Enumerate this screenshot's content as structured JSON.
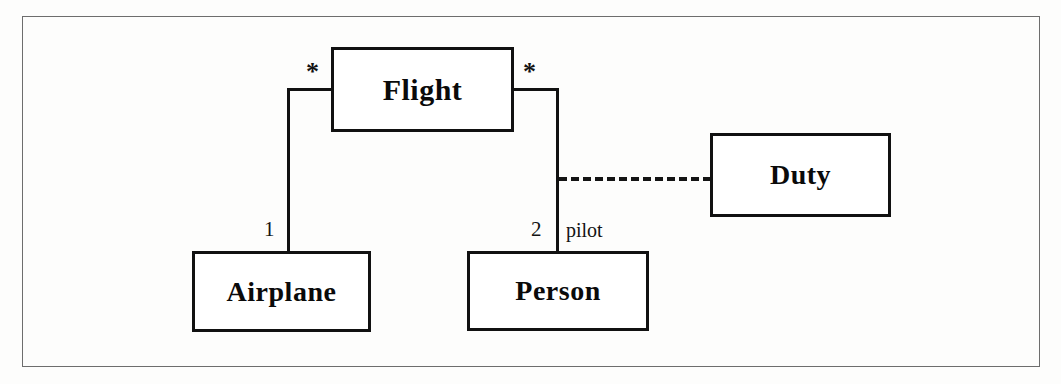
{
  "diagram": {
    "type": "uml-class-diagram",
    "frame": {
      "stroke": "#6d6d6d"
    },
    "background": "#fdfdfc",
    "line_color": "#111111",
    "classes": [
      {
        "id": "flight",
        "name": "Flight",
        "x": 331,
        "y": 47,
        "width": 183,
        "height": 85,
        "font_size": 30
      },
      {
        "id": "airplane",
        "name": "Airplane",
        "x": 192,
        "y": 251,
        "width": 179,
        "height": 81,
        "font_size": 28
      },
      {
        "id": "person",
        "name": "Person",
        "x": 467,
        "y": 251,
        "width": 182,
        "height": 80,
        "font_size": 28
      },
      {
        "id": "duty",
        "name": "Duty",
        "x": 710,
        "y": 133,
        "width": 181,
        "height": 84,
        "font_size": 28
      }
    ],
    "associations": [
      {
        "id": "flight-airplane",
        "from": "Flight",
        "to": "Airplane",
        "style": "solid",
        "source_multiplicity": "*",
        "target_multiplicity": "1"
      },
      {
        "id": "flight-person",
        "from": "Flight",
        "to": "Person",
        "style": "solid",
        "source_multiplicity": "*",
        "target_multiplicity": "2",
        "target_role": "pilot"
      },
      {
        "id": "person-duty",
        "from": "Person",
        "to": "Duty",
        "style": "dashed",
        "source_multiplicity": "",
        "target_multiplicity": ""
      }
    ],
    "labels": {
      "star_left": "*",
      "star_right": "*",
      "mult_one": "1",
      "mult_two": "2",
      "role_pilot": "pilot"
    }
  }
}
